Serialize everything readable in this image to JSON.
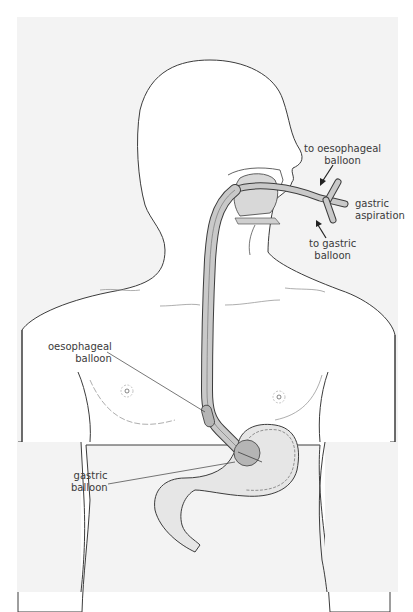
{
  "figure": {
    "colors": {
      "background": "#ffffff",
      "panel": "#f3f3f3",
      "body_fill": "#ffffff",
      "outline": "#3c3c3c",
      "tube_fill": "#c9c9c9",
      "stomach_fill": "#e6e6e6",
      "balloon_fill": "#b5b5b5"
    },
    "labels": {
      "to_oesophageal_balloon": {
        "line1": "to oesophageal",
        "line2": "balloon"
      },
      "gastric_aspiration": {
        "line1": "gastric",
        "line2": "aspiration"
      },
      "to_gastric_balloon": {
        "line1": "to gastric",
        "line2": "balloon"
      },
      "oesophageal_balloon": {
        "line1": "oesophageal",
        "line2": "balloon"
      },
      "gastric_balloon": {
        "line1": "gastric",
        "line2": "balloon"
      }
    },
    "icons": {
      "arrow_to_oesophageal": "arrow-down-left",
      "arrow_to_gastric": "arrow-up-left"
    }
  }
}
